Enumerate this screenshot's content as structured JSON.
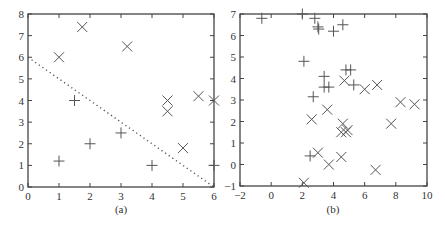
{
  "chart_data": [
    {
      "type": "scatter",
      "caption": "(a)",
      "title": "",
      "xlabel": "",
      "ylabel": "",
      "xlim": [
        0,
        6
      ],
      "ylim": [
        0,
        8
      ],
      "xticks": [
        0,
        1,
        2,
        3,
        4,
        5,
        6
      ],
      "yticks": [
        0,
        1,
        2,
        3,
        4,
        5,
        6,
        7,
        8
      ],
      "grid": false,
      "legend": null,
      "series": [
        {
          "name": "cross",
          "marker": "x",
          "points": [
            [
              1,
              6
            ],
            [
              1.75,
              7.4
            ],
            [
              3.2,
              6.5
            ],
            [
              4.5,
              4
            ],
            [
              4.5,
              3.5
            ],
            [
              5.5,
              4.2
            ],
            [
              6,
              4
            ],
            [
              5,
              1.8
            ]
          ]
        },
        {
          "name": "plus",
          "marker": "+",
          "points": [
            [
              1,
              1.2
            ],
            [
              1.5,
              4
            ],
            [
              2,
              2
            ],
            [
              3,
              2.5
            ],
            [
              4,
              1
            ],
            [
              6,
              1
            ]
          ]
        }
      ],
      "lines": [
        {
          "name": "decision-boundary",
          "style": "dotted",
          "points": [
            [
              0,
              6
            ],
            [
              6,
              0
            ]
          ]
        }
      ]
    },
    {
      "type": "scatter",
      "caption": "(b)",
      "title": "",
      "xlabel": "",
      "ylabel": "",
      "xlim": [
        -2,
        10
      ],
      "ylim": [
        -1,
        7
      ],
      "xticks": [
        -2,
        0,
        2,
        4,
        6,
        8,
        10
      ],
      "yticks": [
        -1,
        0,
        1,
        2,
        3,
        4,
        5,
        6,
        7
      ],
      "grid": false,
      "legend": null,
      "series": [
        {
          "name": "plus",
          "marker": "+",
          "points": [
            [
              -0.6,
              6.8
            ],
            [
              2,
              7
            ],
            [
              2.8,
              6.8
            ],
            [
              3,
              6.4
            ],
            [
              3.05,
              6.3
            ],
            [
              4,
              6.2
            ],
            [
              4.6,
              6.5
            ],
            [
              2.1,
              4.8
            ],
            [
              4.8,
              4.4
            ],
            [
              5.1,
              4.4
            ],
            [
              3.4,
              4.1
            ],
            [
              3.4,
              3.6
            ],
            [
              3.7,
              3.6
            ],
            [
              5.3,
              3.7
            ],
            [
              2.7,
              3.15
            ],
            [
              2.5,
              0.4
            ]
          ]
        },
        {
          "name": "cross",
          "marker": "x",
          "points": [
            [
              4.7,
              3.9
            ],
            [
              6,
              3.5
            ],
            [
              6.8,
              3.7
            ],
            [
              8.3,
              2.9
            ],
            [
              9.2,
              2.8
            ],
            [
              7.7,
              1.9
            ],
            [
              3.6,
              2.55
            ],
            [
              2.6,
              2.1
            ],
            [
              4.6,
              1.9
            ],
            [
              4.5,
              1.5
            ],
            [
              4.9,
              1.6
            ],
            [
              4.8,
              1.5
            ],
            [
              3,
              0.55
            ],
            [
              3.7,
              0.0
            ],
            [
              4.5,
              0.35
            ],
            [
              6.7,
              -0.25
            ],
            [
              2.1,
              -0.85
            ]
          ]
        }
      ]
    }
  ],
  "figure": {
    "panel_a_caption": "(a)",
    "panel_b_caption": "(b)"
  }
}
